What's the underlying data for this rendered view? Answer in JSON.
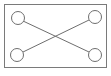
{
  "diagram": {
    "frame": {
      "x": 4,
      "y": 4,
      "width": 103,
      "height": 64,
      "stroke": "#7a7a7a"
    },
    "nodes": [
      {
        "id": "top-left",
        "cx": 18,
        "cy": 18,
        "r": 6.5
      },
      {
        "id": "top-right",
        "cx": 95,
        "cy": 17,
        "r": 6.5
      },
      {
        "id": "bottom-left",
        "cx": 17,
        "cy": 55,
        "r": 6.5
      },
      {
        "id": "bottom-right",
        "cx": 95,
        "cy": 55,
        "r": 6.5
      }
    ],
    "edges": [
      {
        "from": "top-left",
        "to": "bottom-right"
      },
      {
        "from": "top-right",
        "to": "bottom-left"
      }
    ],
    "stroke_color": "#6e6e6e",
    "fill_color": "#ffffff"
  }
}
